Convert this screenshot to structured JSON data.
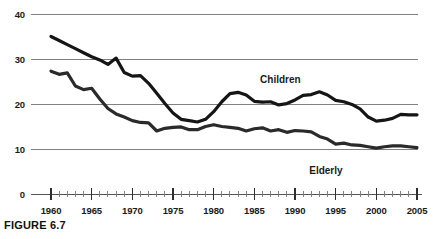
{
  "figure": {
    "caption": "FIGURE 6.7"
  },
  "chart_data": {
    "type": "line",
    "title": "",
    "subtitle": "",
    "xlabel": "",
    "ylabel": "",
    "xlim": [
      1959,
      2005.5
    ],
    "ylim": [
      0,
      40
    ],
    "yticks": [
      0,
      10,
      20,
      30,
      40
    ],
    "ytick_labels": [
      "0",
      "10",
      "20",
      "30",
      "40"
    ],
    "xticks": [
      1960,
      1965,
      1970,
      1975,
      1980,
      1985,
      1990,
      1995,
      2000,
      2005
    ],
    "xtick_labels": [
      "1960",
      "1965",
      "1970",
      "1975",
      "1980",
      "1985",
      "1990",
      "1995",
      "2000",
      "2005"
    ],
    "minor_xtick_interval": 1,
    "grid": "horizontal",
    "gridline_color": "#808080",
    "legend": "inline-annotations",
    "annotations": [
      {
        "text": "Children",
        "x": 1988.2,
        "y": 25.6
      },
      {
        "text": "Elderly",
        "x": 1993.8,
        "y": 5.4
      }
    ],
    "series": [
      {
        "name": "Children",
        "color": "#151515",
        "line_width": 3.2,
        "x": [
          1960,
          1961,
          1962,
          1963,
          1964,
          1965,
          1966,
          1967,
          1968,
          1969,
          1970,
          1971,
          1972,
          1973,
          1974,
          1975,
          1976,
          1977,
          1978,
          1979,
          1980,
          1981,
          1982,
          1983,
          1984,
          1985,
          1986,
          1987,
          1988,
          1989,
          1990,
          1991,
          1992,
          1993,
          1994,
          1995,
          1996,
          1997,
          1998,
          1999,
          2000,
          2001,
          2002,
          2003,
          2004,
          2005
        ],
        "values": [
          35.0,
          34.1,
          33.2,
          32.3,
          31.4,
          30.5,
          29.8,
          28.8,
          30.2,
          27.0,
          26.2,
          26.3,
          24.6,
          22.4,
          20.1,
          18.0,
          16.6,
          16.3,
          16.0,
          16.6,
          18.3,
          20.5,
          22.3,
          22.6,
          22.0,
          20.6,
          20.4,
          20.5,
          19.8,
          20.1,
          20.9,
          21.9,
          22.1,
          22.7,
          22.0,
          20.8,
          20.5,
          19.9,
          18.9,
          17.1,
          16.2,
          16.4,
          16.8,
          17.7,
          17.6,
          17.6
        ]
      },
      {
        "name": "Elderly",
        "color": "#2a2a2a",
        "line_width": 3.2,
        "x": [
          1960,
          1961,
          1962,
          1963,
          1964,
          1965,
          1966,
          1967,
          1968,
          1969,
          1970,
          1971,
          1972,
          1973,
          1974,
          1975,
          1976,
          1977,
          1978,
          1979,
          1980,
          1981,
          1982,
          1983,
          1984,
          1985,
          1986,
          1987,
          1988,
          1989,
          1990,
          1991,
          1992,
          1993,
          1994,
          1995,
          1996,
          1997,
          1998,
          1999,
          2000,
          2001,
          2002,
          2003,
          2004,
          2005
        ],
        "values": [
          27.3,
          26.6,
          26.9,
          24.0,
          23.2,
          23.5,
          21.1,
          19.0,
          17.8,
          17.1,
          16.3,
          15.9,
          15.8,
          14.0,
          14.6,
          14.8,
          14.9,
          14.3,
          14.3,
          15.0,
          15.4,
          15.0,
          14.8,
          14.6,
          14.0,
          14.5,
          14.7,
          14.0,
          14.3,
          13.7,
          14.1,
          14.0,
          13.8,
          12.8,
          12.2,
          11.1,
          11.3,
          10.9,
          10.8,
          10.5,
          10.2,
          10.5,
          10.7,
          10.7,
          10.5,
          10.3
        ]
      }
    ]
  }
}
